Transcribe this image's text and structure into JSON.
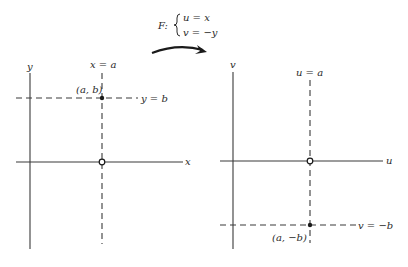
{
  "mapping": {
    "name": "F:",
    "equations": [
      "u = x",
      "v = −y"
    ]
  },
  "left_plane": {
    "axis_labels": {
      "horizontal": "x",
      "vertical": "y"
    },
    "vertical_line_label": "x = a",
    "horizontal_line_label": "y = b",
    "point_label": "(a, b)"
  },
  "right_plane": {
    "axis_labels": {
      "horizontal": "u",
      "vertical": "v"
    },
    "vertical_line_label": "u = a",
    "horizontal_line_label": "v = −b",
    "point_label": "(a, −b)"
  },
  "colors": {
    "ink": "#2a2a2a",
    "background": "#ffffff"
  }
}
